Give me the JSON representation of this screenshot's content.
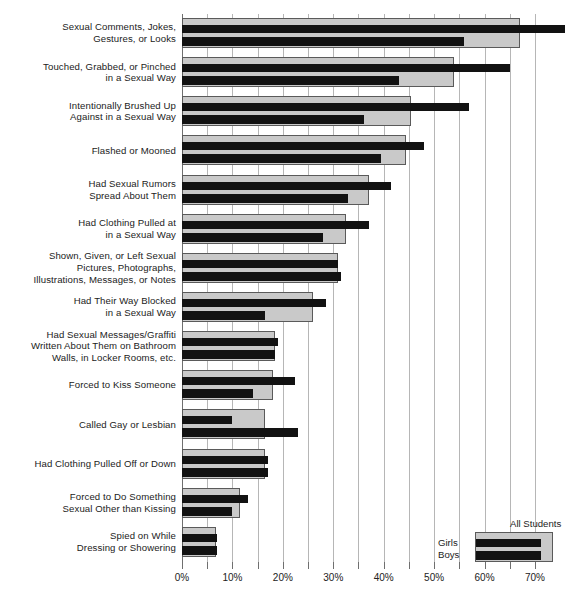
{
  "chart_data": {
    "type": "bar",
    "orientation": "horizontal",
    "title": "",
    "xlabel": "",
    "ylabel": "",
    "xlim": [
      0,
      71
    ],
    "xticks": [
      "0%",
      "5%",
      "10%",
      "15%",
      "20%",
      "25%",
      "30%",
      "35%",
      "40%",
      "45%",
      "50%",
      "55%",
      "60%",
      "65%",
      "70%"
    ],
    "xtick_values": [
      0,
      5,
      10,
      15,
      20,
      25,
      30,
      35,
      40,
      45,
      50,
      55,
      60,
      65,
      70
    ],
    "xtick_labeled": [
      true,
      false,
      true,
      false,
      true,
      false,
      true,
      false,
      true,
      false,
      true,
      false,
      true,
      false,
      true
    ],
    "grid": true,
    "legend_position": "bottom-right",
    "categories": [
      "Sexual Comments, Jokes,\nGestures, or Looks",
      "Touched, Grabbed, or Pinched\nin a Sexual Way",
      "Intentionally Brushed Up\nAgainst in a Sexual Way",
      "Flashed or Mooned",
      "Had Sexual Rumors\nSpread About Them",
      "Had Clothing Pulled at\nin a Sexual Way",
      "Shown, Given, or Left Sexual\nPictures, Photographs,\nIllustrations, Messages, or Notes",
      "Had Their Way Blocked\nin a Sexual Way",
      "Had Sexual Messages/Graffiti\nWritten About Them on Bathroom\nWalls, in Locker Rooms, etc.",
      "Forced to Kiss Someone",
      "Called Gay or Lesbian",
      "Had Clothing Pulled Off or Down",
      "Forced to Do Something\nSexual Other than Kissing",
      "Spied on While\nDressing or Showering"
    ],
    "series": [
      {
        "name": "All Students",
        "color": "#c9c9c9",
        "values": [
          67,
          54,
          45.5,
          44.5,
          37,
          32.5,
          31,
          26,
          18.5,
          18,
          16.5,
          16.5,
          11.5,
          6.8
        ]
      },
      {
        "name": "Girls",
        "color": "#121212",
        "values": [
          76,
          65,
          57,
          48,
          41.5,
          37,
          31,
          28.5,
          19,
          22.5,
          10,
          17,
          13,
          7
        ]
      },
      {
        "name": "Boys",
        "color": "#121212",
        "values": [
          56,
          43,
          36,
          39.5,
          33,
          28,
          31.5,
          16.5,
          18.5,
          14,
          23,
          17,
          10,
          7
        ]
      }
    ]
  },
  "legend": {
    "all_students": "All Students",
    "girls": "Girls",
    "boys": "Boys"
  }
}
